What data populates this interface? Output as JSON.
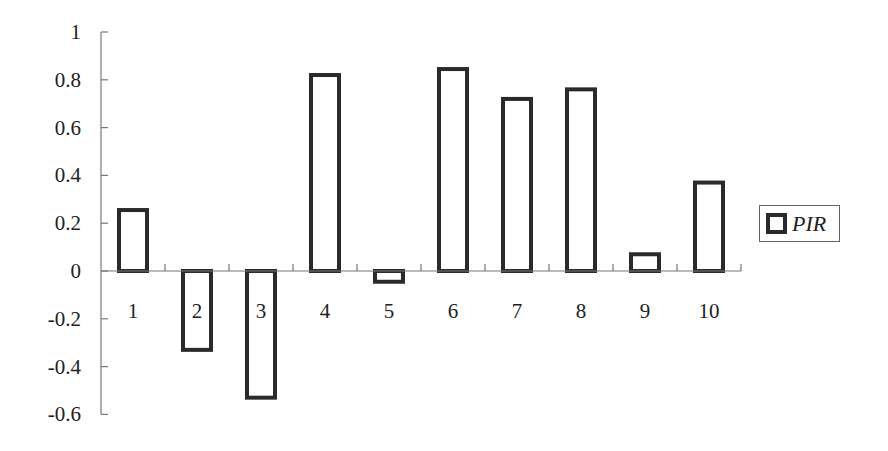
{
  "chart_data": {
    "type": "bar",
    "title": "",
    "xlabel": "",
    "ylabel": "",
    "categories": [
      "1",
      "2",
      "3",
      "4",
      "5",
      "6",
      "7",
      "8",
      "9",
      "10"
    ],
    "series": [
      {
        "name": "PIR",
        "values": [
          0.255,
          -0.33,
          -0.53,
          0.82,
          -0.045,
          0.845,
          0.72,
          0.76,
          0.07,
          0.37
        ]
      }
    ],
    "ylim": [
      -0.6,
      1
    ],
    "yticks": [
      "1",
      "0.8",
      "0.6",
      "0.4",
      "0.2",
      "0",
      "-0.2",
      "-0.4",
      "-0.6"
    ],
    "ytick_values": [
      1,
      0.8,
      0.6,
      0.4,
      0.2,
      0,
      -0.2,
      -0.4,
      -0.6
    ],
    "grid": false,
    "legend_position": "right",
    "bar_style": {
      "fill": "#ffffff",
      "stroke": "#2a2a2a"
    }
  },
  "legend": {
    "label": "PIR"
  }
}
